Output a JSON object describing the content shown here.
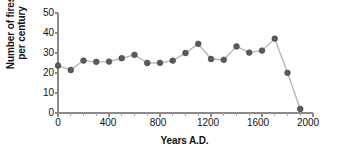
{
  "chart_data": {
    "type": "line",
    "title": "",
    "xlabel": "Years A.D.",
    "ylabel": "Number of fires\nper century",
    "ylabel_line1": "Number of fires",
    "ylabel_line2": "per century",
    "xlim": [
      0,
      2000
    ],
    "ylim": [
      0,
      50
    ],
    "grid": false,
    "legend": "none",
    "marker": "filled-circle",
    "marker_color": "#5a5a5a",
    "line_color": "#b3b3b3",
    "axis_color": "#8a8a8a",
    "x_major_ticks": [
      0,
      400,
      800,
      1200,
      1600,
      2000
    ],
    "x_tick_labels": [
      "0",
      "400",
      "800",
      "1200",
      "1600",
      "2000"
    ],
    "x_minor_tick_step": 100,
    "y_major_ticks": [
      0,
      10,
      20,
      30,
      40,
      50
    ],
    "y_tick_labels": [
      "0",
      "10",
      "20",
      "30",
      "40",
      "50"
    ],
    "x": [
      0,
      100,
      200,
      300,
      400,
      500,
      600,
      700,
      800,
      900,
      1000,
      1100,
      1200,
      1300,
      1400,
      1500,
      1600,
      1700,
      1800,
      1900
    ],
    "values": [
      23.7,
      21.5,
      26.2,
      25.6,
      25.7,
      27.4,
      29.1,
      25.0,
      25.1,
      26.2,
      30.0,
      34.6,
      27.0,
      26.6,
      33.3,
      30.2,
      31.2,
      37.2,
      20.1,
      2.0
    ],
    "series": [
      {
        "name": "Number of fires per century",
        "values": [
          23.7,
          21.5,
          26.2,
          25.6,
          25.7,
          27.4,
          29.1,
          25.0,
          25.1,
          26.2,
          30.0,
          34.6,
          27.0,
          26.6,
          33.3,
          30.2,
          31.2,
          37.2,
          20.1,
          2.0
        ]
      }
    ]
  }
}
